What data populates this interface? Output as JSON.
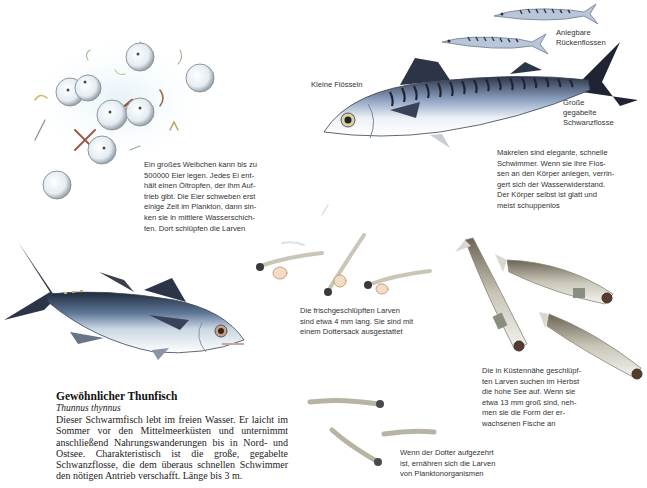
{
  "eggs_caption": {
    "lines": [
      "Ein großes Weibchen kann bis zu",
      "500000 Eier legen. Jedes Ei ent-",
      "hält einen Öltropfen, der ihm Auf-",
      "trieb gibt. Die Eier schweben erst",
      "einige Zeit im Plankton, dann sin-",
      "ken sie in mittlere Wasserschich-",
      "ten. Dort schlüpfen die Larven"
    ]
  },
  "mackerel": {
    "label_small_fins": "Kleine Flösseln",
    "label_dorsal": [
      "Anlegbare",
      "Rückenflossen"
    ],
    "label_tail": [
      "Große",
      "gegabelte",
      "Schwanzflosse"
    ],
    "caption_lines": [
      "Makrelen sind elegante, schnelle",
      "Schwimmer. Wenn sie ihre Flos-",
      "sen an den Körper anlegen, verrin-",
      "gert sich der Wasserwiderstand.",
      "Der Körper selbst ist glatt und",
      "meist schuppenlos"
    ]
  },
  "larvae_hatched_caption": [
    "Die frischgeschlüpften Larven",
    "sind etwa 4 mm lang. Sie sind mit",
    "einem Dottersack ausgestattet"
  ],
  "larvae_coast_caption": [
    "Die in Küstennähe geschlüpf-",
    "ten Larven suchen im Herbst",
    "die hohe See auf. Wenn sie",
    "etwa 13 mm groß sind, neh-",
    "men sie die Form der er-",
    "wachsenen Fische an"
  ],
  "larvae_yolk_caption": [
    "Wenn der Dotter aufgezehrt",
    "ist, ernähren sich die Larven",
    "von Planktonorganismen"
  ],
  "tuna": {
    "title": "Gewöhnlicher Thunfisch",
    "scientific_name": "Thunnus thynnus",
    "description": "Dieser Schwarmfisch lebt im freien Wasser. Er laicht im Sommer vor den Mittelmeerküsten und unternimmt anschließend Nahrungswanderungen bis in Nord- und Ostsee. Charakteristisch ist die große, gegabelte Schwanzflosse, die dem überaus schnellen Schwimmer den nötigen Antrieb verschafft. Länge bis 3 m."
  },
  "colors": {
    "fish_dark": "#2c3448",
    "fish_blue": "#8fa4c4",
    "fish_belly": "#f2f4f8",
    "stripe": "#1f2333",
    "egg": "#e4ecf2",
    "larva": "#c9c6b8",
    "eye": "#5a3a2a"
  }
}
